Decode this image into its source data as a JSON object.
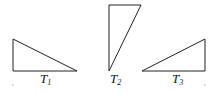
{
  "diagram": {
    "triangles": [
      {
        "id": "T1",
        "label_main": "T",
        "label_sub": "1",
        "points": "13,39 13,71 77,71",
        "label_x": 40,
        "label_y": 83
      },
      {
        "id": "T2",
        "label_main": "T",
        "label_sub": "2",
        "points": "109,5 141,5 109,71",
        "label_x": 110,
        "label_y": 83
      },
      {
        "id": "T3",
        "label_main": "T",
        "label_sub": "3",
        "points": "142,71 205,39 205,71",
        "label_x": 172,
        "label_y": 83
      }
    ],
    "dots": [
      {
        "x": 13,
        "y": 85
      },
      {
        "x": 205,
        "y": 85
      }
    ],
    "stroke_color": "#222222"
  }
}
